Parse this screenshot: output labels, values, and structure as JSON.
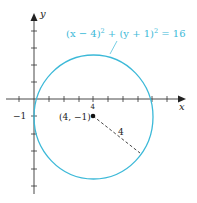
{
  "diagram": {
    "type": "circle-on-cartesian-plane",
    "equation": "(x − 4)² + (y + 1)² = 16",
    "equation_parts": {
      "a": "(x − 4)",
      "a_exp": "2",
      "plus": " + (y + 1)",
      "b_exp": "2",
      "rhs": " = 16"
    },
    "center": {
      "x": 4,
      "y": -1
    },
    "center_label": "(4, −1)",
    "center_tick_label": "4",
    "radius": 4,
    "radius_label": "4",
    "axes": {
      "x_label": "x",
      "y_label": "y",
      "y_tick_label": "−1",
      "x_range": [
        -1,
        10
      ],
      "y_range": [
        -5,
        5
      ]
    },
    "colors": {
      "circle": "#3cb9d8",
      "axes": "#333333",
      "text": "#222222"
    }
  }
}
